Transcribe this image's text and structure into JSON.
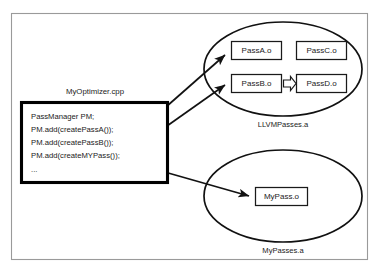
{
  "diagram": {
    "source_file": {
      "label": "MyOptimizer.cpp",
      "code_lines": [
        "PassManager PM;",
        "PM.add(createPassA());",
        "PM.add(createPassB());",
        "PM.add(createMYPass());",
        "..."
      ]
    },
    "archives": [
      {
        "label": "LLVMPasses.a",
        "nodes": [
          {
            "label": "PassA.o"
          },
          {
            "label": "PassC.o"
          },
          {
            "label": "PassB.o"
          },
          {
            "label": "PassD.o"
          }
        ],
        "internal_link": {
          "from": "PassB.o",
          "to": "PassD.o",
          "style": "hollow-block-arrow"
        }
      },
      {
        "label": "MyPasses.a",
        "nodes": [
          {
            "label": "MyPass.o"
          }
        ],
        "internal_link": null
      }
    ],
    "links": [
      {
        "from": "PM.add(createPassA());",
        "to": "PassA.o"
      },
      {
        "from": "PM.add(createPassB());",
        "to": "PassB.o"
      },
      {
        "from": "PM.add(createMYPass());",
        "to": "MyPass.o"
      }
    ],
    "colors": {
      "frame_border": "#9a9a9a",
      "shape_stroke": "#111111",
      "code_box_stroke": "#000000",
      "background": "#ffffff",
      "text": "#1a1a1a"
    }
  }
}
